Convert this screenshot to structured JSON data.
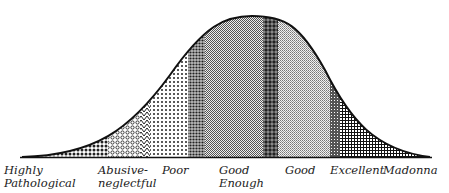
{
  "diagram": {
    "type": "bell-curve",
    "categories": [
      {
        "label_line1": "Highly",
        "label_line2": "Pathological",
        "pattern": "dense-dots",
        "x": 4
      },
      {
        "label_line1": "Abusive-",
        "label_line2": "neglectful",
        "pattern": "circles",
        "x": 98
      },
      {
        "label_line1": "Poor",
        "label_line2": "",
        "pattern": "sparse-dots",
        "x": 162
      },
      {
        "label_line1": "Good",
        "label_line2": "Enough",
        "pattern": "fine-checker",
        "x": 218
      },
      {
        "label_line1": "Good",
        "label_line2": "",
        "pattern": "light-checker",
        "x": 285
      },
      {
        "label_line1": "Excellent",
        "label_line2": "",
        "pattern": "grid",
        "x": 331
      },
      {
        "label_line1": "Madonna",
        "label_line2": "",
        "pattern": "grid-tail",
        "x": 384
      }
    ]
  }
}
